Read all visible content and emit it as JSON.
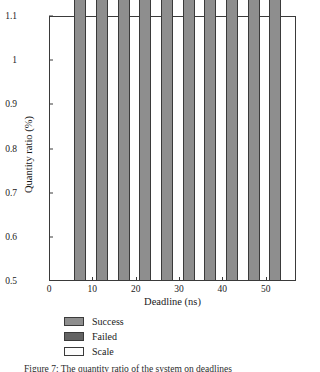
{
  "chart_data": {
    "type": "bar",
    "title": "",
    "xlabel": "Deadline (ns)",
    "ylabel": "Quantity ratio (%)",
    "xlim": [
      0,
      57
    ],
    "ylim": [
      0.5,
      1.1
    ],
    "xticks": [
      "0",
      "10",
      "20",
      "30",
      "40",
      "50"
    ],
    "xtick_values": [
      0,
      10,
      20,
      30,
      40,
      50
    ],
    "yticks": [
      "0.5",
      "0.6",
      "0.7",
      "0.8",
      "0.9",
      "1",
      "1.1"
    ],
    "ytick_values": [
      0.5,
      0.6,
      0.7,
      0.8,
      0.9,
      1.0,
      1.1
    ],
    "grid": false,
    "stacked": true,
    "legend_position": "below-left",
    "series": [
      {
        "name": "Success",
        "color": "#8e8e8e"
      },
      {
        "name": "Failed",
        "color": "#636363"
      },
      {
        "name": "Scale",
        "color": "#fcfcfc"
      }
    ],
    "bars": [
      {
        "deadline": 10,
        "x": 7,
        "success": 0.7,
        "failed": 0.207,
        "scale": 0.093,
        "total": 1.0
      },
      {
        "deadline": 10,
        "x": 12,
        "success": 0.84,
        "failed": 0.084,
        "scale": 0.076,
        "total": 1.0
      },
      {
        "deadline": 20,
        "x": 17,
        "success": 0.773,
        "failed": 0.0,
        "scale": 0.227,
        "total": 1.0
      },
      {
        "deadline": 20,
        "x": 22,
        "success": 0.867,
        "failed": 0.01,
        "scale": 0.123,
        "total": 1.0
      },
      {
        "deadline": 30,
        "x": 27,
        "success": 0.867,
        "failed": 0.0,
        "scale": 0.133,
        "total": 1.0
      },
      {
        "deadline": 30,
        "x": 32,
        "success": 0.95,
        "failed": 0.013,
        "scale": 0.037,
        "total": 1.0
      },
      {
        "deadline": 40,
        "x": 37,
        "success": 0.942,
        "failed": 0.0,
        "scale": 0.058,
        "total": 1.0
      },
      {
        "deadline": 40,
        "x": 42,
        "success": 1.0,
        "failed": 0.0,
        "scale": 0.0,
        "total": 1.0
      },
      {
        "deadline": 50,
        "x": 47,
        "success": 0.97,
        "failed": 0.0,
        "scale": 0.03,
        "total": 1.0
      },
      {
        "deadline": 50,
        "x": 52,
        "success": 1.0,
        "failed": 0.0,
        "scale": 0.0,
        "total": 1.0
      }
    ]
  },
  "legend": {
    "items": [
      {
        "label": "Success",
        "key": "success"
      },
      {
        "label": "Failed",
        "key": "failed"
      },
      {
        "label": "Scale",
        "key": "scale"
      }
    ]
  },
  "caption": {
    "text": "Figure 7: The quantity ratio of the system on deadlines"
  }
}
